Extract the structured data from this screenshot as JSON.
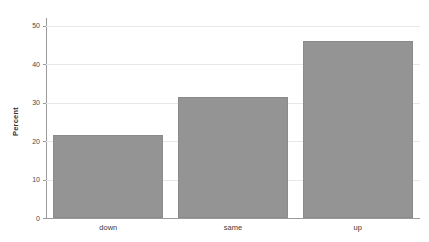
{
  "chart_data": {
    "type": "bar",
    "title": "",
    "xlabel": "",
    "ylabel": "Percent",
    "categories": [
      "down",
      "same",
      "up"
    ],
    "values": [
      21.5,
      31.5,
      46.0
    ],
    "ylim": [
      0,
      52
    ],
    "yticks": [
      0,
      10,
      20,
      30,
      40,
      50
    ],
    "ytick_labels": [
      "0",
      "10",
      "20",
      "30",
      "40",
      "50"
    ],
    "grid": "horizontal",
    "legend": "none",
    "bar_color": "#949494",
    "bar_edge_color": "#8a8a8a",
    "grid_color": "#e8e8e8",
    "axis_color": "#9a9a9a",
    "background": "#ffffff"
  },
  "axes": {
    "y_label": "Percent",
    "y_tick_0": "0",
    "y_tick_1": "10",
    "y_tick_2": "20",
    "y_tick_3": "30",
    "y_tick_4": "40",
    "y_tick_5": "50"
  },
  "categories": {
    "cat_0": "down",
    "cat_1": "same",
    "cat_2": "up"
  },
  "title": {
    "text": ""
  }
}
